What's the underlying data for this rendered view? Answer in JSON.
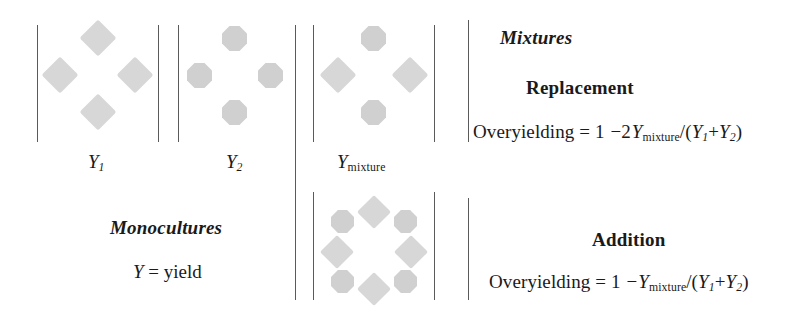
{
  "figure": {
    "background_color": "#ffffff",
    "rule_color": "#5a5a5a",
    "diamond_color": "#d7d7d7",
    "octagon_color": "#d0d0d0"
  },
  "panels": {
    "y1": {
      "label_var": "Y",
      "label_sub": "1",
      "shape": "diamond",
      "count": 4
    },
    "y2": {
      "label_var": "Y",
      "label_sub": "2",
      "shape": "octagon",
      "count": 4
    },
    "y_mixture": {
      "label_var": "Y",
      "label_sub": "mixture",
      "shapes": "diamond+octagon",
      "count": 4
    },
    "addition_plot": {
      "shapes": "diamond+octagon",
      "count": 8
    }
  },
  "legends": {
    "monocultures_heading": "Monocultures",
    "yield_definition_var": "Y",
    "yield_definition_rest": " = yield",
    "mixtures_heading": "Mixtures"
  },
  "replacement": {
    "heading": "Replacement",
    "formula_lhs": "Overyielding = 1 ",
    "formula_minus": "−2",
    "formula_var": "Y",
    "formula_sub": "mixture",
    "formula_denom_open": "/(",
    "formula_y1": "Y",
    "formula_y1_sub": "1",
    "formula_plus": "+",
    "formula_y2": "Y",
    "formula_y2_sub": "2",
    "formula_close": ")"
  },
  "addition": {
    "heading": "Addition",
    "formula_lhs": "Overyielding = 1 ",
    "formula_minus": "−",
    "formula_var": "Y",
    "formula_sub": "mixture",
    "formula_denom_open": "/(",
    "formula_y1": "Y",
    "formula_y1_sub": "1",
    "formula_plus": "+",
    "formula_y2": "Y",
    "formula_y2_sub": "2",
    "formula_close": ")"
  }
}
